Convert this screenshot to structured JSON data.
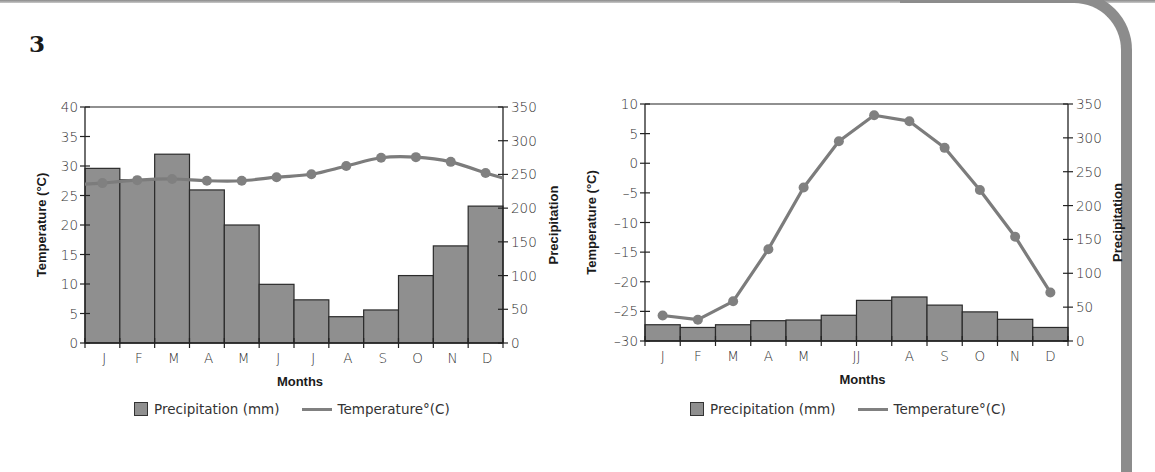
{
  "question_number": "3",
  "colors": {
    "bar_fill": "#8f8f8f",
    "bar_stroke": "#2b2b2b",
    "line": "#7c7c7c",
    "marker": "#808080",
    "axis": "#222222",
    "border": "#8c8c8c"
  },
  "legend": {
    "precipitation": "Precipitation (mm)",
    "temperature": "Temperature°(C)"
  },
  "chart_data": [
    {
      "type": "bar+line",
      "title": "",
      "xlabel": "Months",
      "ylabel_left": "Temperature (°C)",
      "ylabel_right": "Precipitation",
      "tick_labels_x": [
        "J",
        "F",
        "M",
        "A",
        "M",
        "J",
        "J",
        "A",
        "S",
        "O",
        "N",
        "D"
      ],
      "categories": [
        "J",
        "F",
        "M",
        "A",
        "M",
        "J",
        "J",
        "A",
        "S",
        "O",
        "N",
        "D"
      ],
      "ylim_left": [
        0,
        40
      ],
      "yticks_left": [
        0,
        5,
        10,
        15,
        20,
        25,
        30,
        35,
        40
      ],
      "ylim_right": [
        0,
        350
      ],
      "yticks_right": [
        0,
        50,
        100,
        150,
        200,
        250,
        300,
        350
      ],
      "grid": false,
      "legend_position": "bottom",
      "series": [
        {
          "name": "Precipitation (mm)",
          "type": "bar",
          "axis": "right",
          "values": [
            259,
            242,
            280,
            227,
            175,
            87,
            64,
            39,
            49,
            100,
            144,
            203
          ]
        },
        {
          "name": "Temperature°(C)",
          "type": "line",
          "axis": "left",
          "values": [
            27.1,
            27.6,
            27.8,
            27.5,
            27.5,
            28.1,
            28.6,
            30.0,
            31.4,
            31.5,
            30.7,
            28.8
          ]
        }
      ]
    },
    {
      "type": "bar+line",
      "title": "",
      "xlabel": "Months",
      "ylabel_left": "Temperature (°C)",
      "ylabel_right": "Precipitation",
      "tick_labels_x": [
        "J",
        "F",
        "M",
        "A",
        "M",
        "JJ",
        "A",
        "S",
        "O",
        "N",
        "D"
      ],
      "categories": [
        "J",
        "F",
        "M",
        "A",
        "M",
        "J",
        "J",
        "A",
        "S",
        "O",
        "N",
        "D"
      ],
      "ylim_left": [
        -30,
        10
      ],
      "yticks_left": [
        -30,
        -25,
        -20,
        -15,
        -10,
        -5,
        0,
        5,
        10
      ],
      "ylim_right": [
        0,
        350
      ],
      "yticks_right": [
        0,
        50,
        100,
        150,
        200,
        250,
        300,
        350
      ],
      "grid": false,
      "legend_position": "bottom",
      "series": [
        {
          "name": "Precipitation (mm)",
          "type": "bar",
          "axis": "right",
          "values": [
            24,
            20,
            24,
            30,
            31,
            38,
            60,
            65,
            53,
            43,
            32,
            20
          ]
        },
        {
          "name": "Temperature°(C)",
          "type": "line",
          "axis": "left",
          "values": [
            -25.7,
            -26.4,
            -23.3,
            -14.5,
            -4.1,
            3.7,
            8.1,
            7.1,
            2.6,
            -4.5,
            -12.4,
            -21.8
          ]
        }
      ]
    }
  ]
}
